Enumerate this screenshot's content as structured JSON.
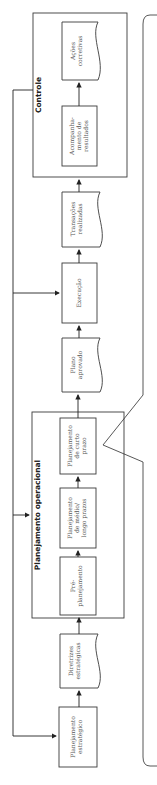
{
  "diagram": {
    "groups": {
      "controle": "Controle",
      "operacional": "Planejamento operacional"
    },
    "nodes": {
      "estrategico": [
        "Planejamento",
        "estratégico"
      ],
      "diretrizes": [
        "Diretrizes",
        "estratégicas"
      ],
      "pre": [
        "Pré-",
        "planejamento"
      ],
      "medio": [
        "Planejamento",
        "de médio/",
        "longo prazos"
      ],
      "curto": [
        "Planejamento",
        "de curto",
        "prazo"
      ],
      "plano": [
        "Plano",
        "aprovado"
      ],
      "execucao": [
        "Execução"
      ],
      "transacoes": [
        "Transações",
        "realizadas"
      ],
      "acompanhamento": [
        "Acompanha-",
        "mento de",
        "resultados"
      ],
      "acoes": [
        "Ações",
        "corretivas"
      ]
    },
    "flow": [
      "Planejamento estratégico",
      "Diretrizes estratégicas",
      "Pré-planejamento",
      "Planejamento de médio/longo prazos",
      "Planejamento de curto prazo",
      "Plano aprovado",
      "Execução",
      "Transações realizadas",
      "Acompanhamento de resultados",
      "Ações corretivas"
    ],
    "colors": {
      "line": "#3a3a3a",
      "text": "#555555"
    }
  }
}
